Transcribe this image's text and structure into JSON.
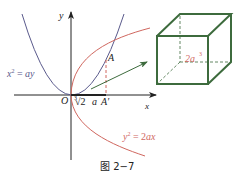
{
  "figure": {
    "caption": "图 2−7",
    "axes": {
      "x_label": "x",
      "y_label": "y",
      "origin_label": "O"
    },
    "curves": [
      {
        "name": "parabola-1",
        "equation": "x² = ay",
        "color": "#5a5a8c"
      },
      {
        "name": "parabola-2",
        "equation": "y² = 2ax",
        "color": "#d0675f"
      }
    ],
    "points": {
      "A": "A",
      "A_prime": "A′"
    },
    "segment_label": "∛2 a",
    "segment_label_parts": {
      "index": "3",
      "radicand": "√2",
      "var": "a"
    },
    "cube": {
      "label": "2a³",
      "label_base": "2a",
      "label_exp": "3",
      "color": "#3d6b3d"
    },
    "colors": {
      "axis": "#222222",
      "red": "#d0675f",
      "blue": "#5a5a8c",
      "green": "#3d6b3d",
      "arrow": "#3d6b3d"
    }
  }
}
